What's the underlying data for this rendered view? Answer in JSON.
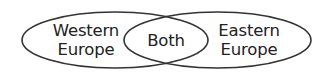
{
  "diagram": {
    "type": "venn",
    "stroke_color": "#333333",
    "text_color": "#222222",
    "background": "#ffffff",
    "sets": [
      {
        "id": "western-europe",
        "label_lines": [
          "Western",
          "Europe"
        ]
      },
      {
        "id": "eastern-europe",
        "label_lines": [
          "Eastern",
          "Europe"
        ]
      }
    ],
    "intersection": {
      "label": "Both"
    }
  }
}
